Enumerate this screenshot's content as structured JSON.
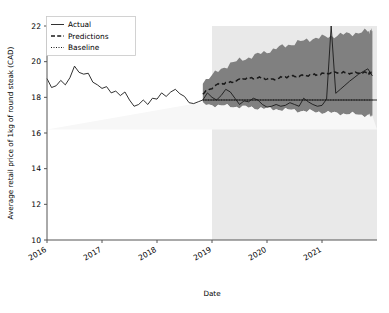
{
  "chart_data": {
    "type": "line",
    "title": "",
    "xlabel": "Date",
    "ylabel": "Average retail price of 1kg of round steak (CAD)",
    "ylim": [
      10,
      22
    ],
    "yticks": [
      10,
      12,
      14,
      16,
      18,
      20,
      22
    ],
    "ytick_labels": [
      "10",
      "12",
      "14",
      "16",
      "18",
      "20",
      "22"
    ],
    "xlim": [
      "2016-01",
      "2021-12"
    ],
    "xticks": [
      "2016",
      "2017",
      "2018",
      "2019",
      "2020",
      "2021"
    ],
    "xtick_labels": [
      "2016",
      "2017",
      "2018",
      "2019",
      "2020",
      "2021"
    ],
    "grid": false,
    "legend_position": "upper left",
    "legend": [
      {
        "label": "Actual",
        "style": "solid",
        "color": "#1a1a1a"
      },
      {
        "label": "Predictions",
        "style": "dashed",
        "color": "#1a1a1a"
      },
      {
        "label": "Baseline",
        "style": "dotted",
        "color": "#1a1a1a"
      }
    ],
    "forecast_start": "2018-11",
    "forecast_shading_color": "#e9e9e9",
    "interval_band_color": "#808080",
    "annotations": [
      {
        "text": "forecast region shaded from late 2018 onward"
      },
      {
        "text": "actual spike to ~22.0 around mid 2020"
      }
    ],
    "series": [
      {
        "name": "Actual",
        "style": "solid",
        "x": [
          "2016-01",
          "2016-02",
          "2016-03",
          "2016-04",
          "2016-05",
          "2016-06",
          "2016-07",
          "2016-08",
          "2016-09",
          "2016-10",
          "2016-11",
          "2016-12",
          "2017-01",
          "2017-02",
          "2017-03",
          "2017-04",
          "2017-05",
          "2017-06",
          "2017-07",
          "2017-08",
          "2017-09",
          "2017-10",
          "2017-11",
          "2017-12",
          "2018-01",
          "2018-02",
          "2018-03",
          "2018-04",
          "2018-05",
          "2018-06",
          "2018-07",
          "2018-08",
          "2018-09",
          "2018-10",
          "2018-11",
          "2018-12",
          "2019-01",
          "2019-02",
          "2019-03",
          "2019-04",
          "2019-05",
          "2019-06",
          "2019-07",
          "2019-08",
          "2019-09",
          "2019-10",
          "2019-11",
          "2019-12",
          "2020-01",
          "2020-02",
          "2020-03",
          "2020-04",
          "2020-05",
          "2020-06",
          "2020-07",
          "2020-08",
          "2020-09",
          "2020-10",
          "2020-11",
          "2020-12",
          "2021-01",
          "2021-02",
          "2021-03",
          "2021-04",
          "2021-05",
          "2021-06",
          "2021-07",
          "2021-08",
          "2021-09",
          "2021-10",
          "2021-11",
          "2021-12"
        ],
        "values": [
          19.05,
          18.55,
          18.65,
          18.95,
          18.7,
          19.1,
          19.75,
          19.4,
          19.3,
          19.35,
          18.85,
          18.7,
          18.5,
          18.6,
          18.25,
          18.35,
          18.1,
          18.3,
          17.85,
          17.5,
          17.6,
          17.85,
          17.6,
          17.95,
          17.9,
          18.25,
          18.05,
          18.3,
          18.45,
          18.2,
          18.05,
          17.7,
          17.65,
          17.75,
          17.85,
          18.25,
          18.0,
          17.85,
          18.1,
          18.45,
          18.3,
          17.95,
          17.6,
          17.8,
          17.75,
          17.95,
          17.85,
          17.6,
          17.45,
          17.5,
          17.6,
          17.5,
          17.55,
          17.7,
          17.6,
          17.5,
          17.95,
          17.75,
          17.6,
          17.5,
          17.55,
          17.9,
          22.0,
          18.2,
          18.0,
          18.35,
          17.8,
          17.7,
          17.8,
          17.85,
          17.75,
          17.8
        ]
      },
      {
        "name": "Actual (tail)",
        "style": "solid",
        "note": "continuation of Actual through 2021 rise",
        "x": [
          "2021-01",
          "2021-03",
          "2021-05",
          "2021-07",
          "2021-09",
          "2021-11",
          "2021-12"
        ],
        "values": [
          17.8,
          18.0,
          18.45,
          18.9,
          19.3,
          19.6,
          19.2
        ]
      },
      {
        "name": "Predictions",
        "style": "dashed",
        "x": [
          "2018-11",
          "2019-02",
          "2019-05",
          "2019-08",
          "2019-11",
          "2020-02",
          "2020-05",
          "2020-08",
          "2020-11",
          "2021-02",
          "2021-05",
          "2021-08",
          "2021-11",
          "2021-12"
        ],
        "values": [
          18.2,
          18.7,
          18.85,
          19.05,
          19.1,
          19.0,
          19.15,
          19.2,
          19.25,
          19.35,
          19.4,
          19.35,
          19.4,
          19.3
        ]
      },
      {
        "name": "Baseline",
        "style": "dotted",
        "x": [
          "2018-11",
          "2021-12"
        ],
        "values": [
          17.85,
          17.85
        ]
      },
      {
        "name": "Prediction interval upper",
        "style": "band",
        "x": [
          "2018-11",
          "2019-05",
          "2019-11",
          "2020-05",
          "2020-11",
          "2021-05",
          "2021-11",
          "2021-12"
        ],
        "values": [
          18.9,
          19.9,
          20.4,
          20.9,
          21.3,
          21.5,
          21.7,
          21.75
        ]
      },
      {
        "name": "Prediction interval lower",
        "style": "band",
        "x": [
          "2018-11",
          "2019-05",
          "2019-11",
          "2020-05",
          "2020-11",
          "2021-05",
          "2021-11",
          "2021-12"
        ],
        "values": [
          17.6,
          17.5,
          17.4,
          17.3,
          17.2,
          17.1,
          17.0,
          16.95
        ]
      }
    ]
  }
}
